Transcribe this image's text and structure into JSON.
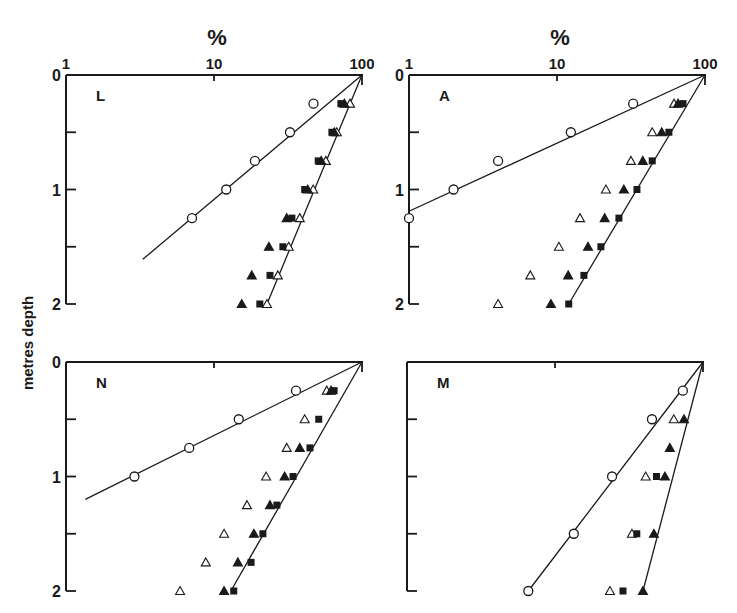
{
  "figure": {
    "x_unit_label": "%",
    "y_axis_label": "metres depth",
    "colors": {
      "ink": "#1a1a1a",
      "background": "#ffffff"
    }
  },
  "chart_data": [
    {
      "type": "scatter",
      "panel": "L",
      "xscale": "log",
      "xlim": [
        1,
        100
      ],
      "xticks": [
        "1",
        "10",
        "100"
      ],
      "ylim": [
        0,
        2
      ],
      "yticks": [
        "0",
        "1",
        "2"
      ],
      "y_inverted": true,
      "xlabel": "%",
      "ylabel": "metres depth",
      "depths": [
        0.25,
        0.5,
        0.75,
        1.0,
        1.25,
        1.5,
        1.75,
        2.0
      ],
      "series": [
        {
          "marker": "open-circle",
          "values": [
            47,
            32.6,
            18.9,
            12.1,
            7.1,
            null,
            null,
            null
          ]
        },
        {
          "marker": "open-triangle",
          "values": [
            83,
            67.6,
            57,
            46.8,
            38,
            32,
            27,
            22.8
          ]
        },
        {
          "marker": "filled-square",
          "values": [
            72,
            62.6,
            50.6,
            41,
            33.6,
            29.2,
            23.9,
            20.4
          ]
        },
        {
          "marker": "filled-triangle",
          "values": [
            76,
            65,
            53,
            43,
            31,
            23.5,
            18,
            15.4
          ]
        }
      ],
      "lines": [
        {
          "from": [
            100,
            0
          ],
          "to": [
            3.3,
            1.61
          ]
        },
        {
          "from": [
            100,
            0
          ],
          "to": [
            22.8,
            2.0
          ]
        }
      ]
    },
    {
      "type": "scatter",
      "panel": "A",
      "xscale": "log",
      "xlim": [
        1,
        100
      ],
      "xticks": [
        "1",
        "10",
        "100"
      ],
      "ylim": [
        0,
        2
      ],
      "yticks": [
        "0",
        "1",
        "2"
      ],
      "y_inverted": true,
      "xlabel": "%",
      "ylabel": "metres depth",
      "depths": [
        0.25,
        0.5,
        0.75,
        1.0,
        1.25,
        1.5,
        1.75,
        2.0
      ],
      "series": [
        {
          "marker": "open-circle",
          "values": [
            32.7,
            12.4,
            4.0,
            2.0,
            1.0,
            null,
            null,
            null
          ]
        },
        {
          "marker": "open-triangle",
          "values": [
            61.8,
            44,
            31.6,
            21.4,
            14.3,
            10.3,
            6.6,
            4.0
          ]
        },
        {
          "marker": "filled-triangle",
          "values": [
            65.8,
            51,
            38,
            28.3,
            21,
            16.2,
            11.9,
            9.1
          ]
        },
        {
          "marker": "filled-square",
          "values": [
            71,
            57,
            44,
            34.7,
            26.2,
            19.8,
            15.2,
            12
          ]
        }
      ],
      "lines": [
        {
          "from": [
            100,
            0
          ],
          "to": [
            1,
            1.19
          ]
        },
        {
          "from": [
            100,
            0
          ],
          "to": [
            12,
            2.0
          ]
        }
      ]
    },
    {
      "type": "scatter",
      "panel": "N",
      "xscale": "log",
      "xlim": [
        1,
        100
      ],
      "xticks": [
        "1",
        "10",
        "100"
      ],
      "ylim": [
        0,
        2
      ],
      "yticks": [
        "0",
        "1",
        "2"
      ],
      "y_inverted": true,
      "xlabel": "%",
      "ylabel": "metres depth",
      "depths": [
        0.25,
        0.5,
        0.75,
        1.0,
        1.25,
        1.5,
        1.75,
        2.0
      ],
      "series": [
        {
          "marker": "open-circle",
          "values": [
            35.8,
            14.7,
            6.8,
            2.9,
            null,
            null,
            null,
            null
          ]
        },
        {
          "marker": "open-triangle",
          "values": [
            57.8,
            41,
            31,
            22.5,
            16.7,
            11.7,
            8.8,
            5.9
          ]
        },
        {
          "marker": "filled-triangle",
          "values": [
            61.8,
            null,
            38,
            30,
            23.9,
            18.6,
            14.5,
            11.7
          ]
        },
        {
          "marker": "filled-square",
          "values": [
            64.8,
            51,
            44.5,
            34.2,
            26.6,
            21.4,
            17.8,
            13.6
          ]
        }
      ],
      "lines": [
        {
          "from": [
            100,
            0
          ],
          "to": [
            1.35,
            1.2
          ]
        },
        {
          "from": [
            100,
            0
          ],
          "to": [
            13,
            2.0
          ]
        }
      ]
    },
    {
      "type": "scatter",
      "panel": "M",
      "xscale": "log",
      "xlim": [
        1,
        100
      ],
      "xticks": [
        "1",
        "10",
        "100"
      ],
      "ylim": [
        0,
        2
      ],
      "yticks": [
        "0",
        "1",
        "2"
      ],
      "y_inverted": true,
      "xlabel": "%",
      "ylabel": "metres depth",
      "depths": [
        0.25,
        0.5,
        0.75,
        1.0,
        1.25,
        1.5,
        1.75,
        2.0
      ],
      "series": [
        {
          "marker": "open-circle",
          "values": [
            73.1,
            45.2,
            null,
            24.3,
            null,
            13.4,
            null,
            6.6
          ]
        },
        {
          "marker": "open-triangle",
          "values": [
            null,
            63.5,
            null,
            41,
            null,
            33.1,
            null,
            23.5
          ]
        },
        {
          "marker": "filled-triangle",
          "values": [
            null,
            74.4,
            59.7,
            55.3,
            null,
            46.6,
            null,
            39.3
          ]
        },
        {
          "marker": "filled-square",
          "values": [
            null,
            null,
            null,
            48.5,
            null,
            35.7,
            null,
            28.8
          ]
        }
      ],
      "lines": [
        {
          "from": [
            100,
            0
          ],
          "to": [
            6.6,
            2.0
          ]
        },
        {
          "from": [
            100,
            0
          ],
          "to": [
            39.3,
            2.0
          ]
        }
      ]
    }
  ],
  "layout": {
    "panels": [
      {
        "x0": 66,
        "y0": 75,
        "show_top_labels": true,
        "show_left_labels": true
      },
      {
        "x0": 409,
        "y0": 75,
        "show_top_labels": true,
        "show_left_labels": true
      },
      {
        "x0": 66,
        "y0": 362,
        "show_top_labels": false,
        "show_left_labels": true
      },
      {
        "x0": 407,
        "y0": 362,
        "show_top_labels": false,
        "show_left_labels": false
      }
    ],
    "decade_px": 148,
    "depth_px_per_m": 114.5
  }
}
